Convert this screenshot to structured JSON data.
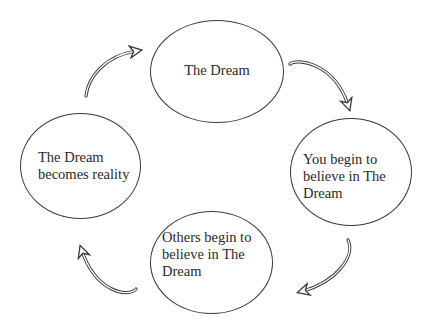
{
  "diagram": {
    "type": "cycle",
    "colors": {
      "stroke": "#3a3a3a",
      "text": "#2a2a2a",
      "background": "#ffffff"
    },
    "nodes": [
      {
        "id": "top",
        "label": "The Dream"
      },
      {
        "id": "right",
        "label": "You begin to\nbelieve in The\nDream"
      },
      {
        "id": "bottom",
        "label": "Others begin to\nbelieve in The\nDream"
      },
      {
        "id": "left",
        "label": "The Dream\nbecomes reality"
      }
    ],
    "edges": [
      {
        "from": "top",
        "to": "right",
        "icon": "curved-arrow-icon"
      },
      {
        "from": "right",
        "to": "bottom",
        "icon": "curved-arrow-icon"
      },
      {
        "from": "bottom",
        "to": "left",
        "icon": "curved-arrow-icon"
      },
      {
        "from": "left",
        "to": "top",
        "icon": "curved-arrow-icon"
      }
    ]
  }
}
